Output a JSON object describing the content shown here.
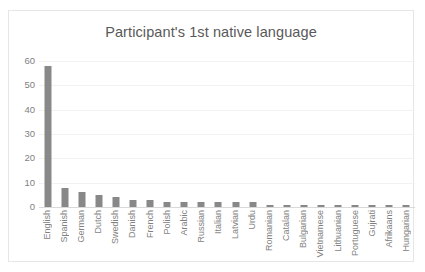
{
  "chart_data": {
    "type": "bar",
    "title": "Participant's 1st native language",
    "xlabel": "",
    "ylabel": "",
    "ylim": [
      0,
      60
    ],
    "yticks": [
      0,
      10,
      20,
      30,
      40,
      50,
      60
    ],
    "grid": true,
    "legend": false,
    "bar_color": "#888888",
    "categories": [
      "English",
      "Spanish",
      "German",
      "Dutch",
      "Swedish",
      "Danish",
      "French",
      "Polish",
      "Arabic",
      "Russian",
      "Italian",
      "Latvian",
      "Urdu",
      "Romanian",
      "Catalan",
      "Bulgarian",
      "Vietnamese",
      "Lithuanian",
      "Portuguese",
      "Gujrati",
      "Afrikaans",
      "Hungarian"
    ],
    "values": [
      58,
      8,
      6,
      5,
      4,
      3,
      3,
      2,
      2,
      2,
      2,
      2,
      2,
      1,
      1,
      1,
      1,
      1,
      1,
      1,
      1,
      1
    ]
  }
}
